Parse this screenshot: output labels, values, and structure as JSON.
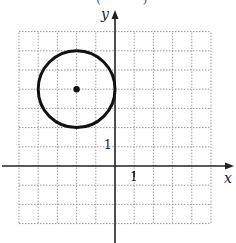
{
  "diagram": {
    "type": "coordinate-plane-circle",
    "top_partial_text": "(          )",
    "axes": {
      "x_label": "x",
      "y_label": "y",
      "x_tick_label": "1",
      "y_tick_label": "1",
      "x_range": [
        -5,
        5
      ],
      "y_range": [
        -3,
        7
      ]
    },
    "grid": {
      "step": 1,
      "style": "dotted",
      "color": "#9a9a9a"
    },
    "circle": {
      "center": [
        -2,
        4
      ],
      "radius": 2,
      "stroke": "#111111",
      "stroke_width": 3
    },
    "center_point": {
      "x": -2,
      "y": 4,
      "color": "#111111"
    },
    "axis_color": "#222222"
  }
}
